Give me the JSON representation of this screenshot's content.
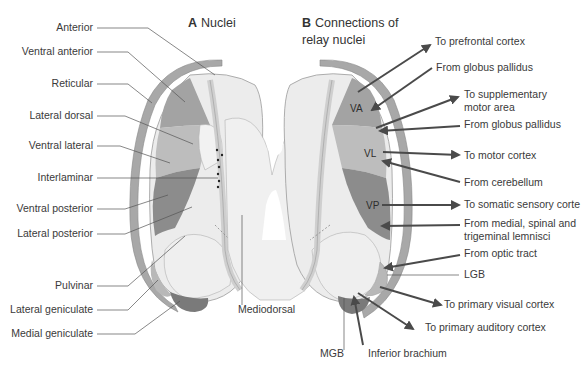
{
  "panel_a": {
    "letter": "A",
    "title": "Nuclei",
    "labels": {
      "anterior": "Anterior",
      "ventral_anterior": "Ventral anterior",
      "reticular": "Reticular",
      "lateral_dorsal": "Lateral dorsal",
      "ventral_lateral": "Ventral lateral",
      "interlaminar": "Interlaminar",
      "ventral_posterior": "Ventral posterior",
      "lateral_posterior": "Lateral posterior",
      "pulvinar": "Pulvinar",
      "lateral_geniculate": "Lateral geniculate",
      "medial_geniculate": "Medial geniculate",
      "mediodorsal": "Mediodorsal"
    }
  },
  "panel_b": {
    "letter": "B",
    "title_line1": "Connections of",
    "title_line2": "relay nuclei",
    "nucleus_abbr": {
      "va": "VA",
      "vl": "VL",
      "vp": "VP"
    },
    "connections": {
      "to_prefrontal": "To prefrontal cortex",
      "from_globus_pallidus_1": "From globus pallidus",
      "to_supplementary_1": "To supplementary",
      "to_supplementary_2": "motor area",
      "from_globus_pallidus_2": "From globus pallidus",
      "to_motor": "To motor cortex",
      "from_cerebellum": "From cerebellum",
      "to_somatic_sensory": "To somatic sensory corte",
      "from_lemnisci_1": "From medial, spinal and",
      "from_lemnisci_2": "trigeminal lemnisci",
      "from_optic_tract": "From optic tract",
      "lgb": "LGB",
      "to_primary_visual": "To primary visual cortex",
      "to_primary_auditory": "To primary auditory cortex",
      "mgb": "MGB",
      "inferior_brachium": "Inferior brachium"
    }
  },
  "colors": {
    "reticular_shell": "#a8a8a8",
    "light_nucleus": "#ececec",
    "lamina": "#dcdcdc",
    "ventral_anterior": "#a3a3a3",
    "ventral_lateral": "#bdbdbd",
    "ventral_posterior": "#8c8c8c",
    "geniculate_medial": "#7a7a7a",
    "geniculate_lateral": "#b8b8b8",
    "arrow": "#4a4a4a",
    "leader": "#555555"
  }
}
